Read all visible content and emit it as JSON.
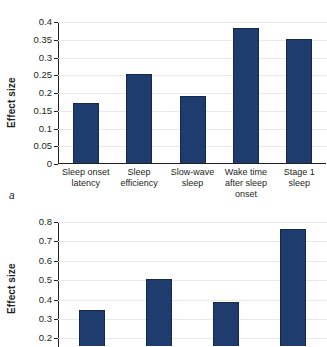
{
  "figure": {
    "panels": [
      {
        "letter": "a",
        "ylabel": "Effect size",
        "chart_data": {
          "type": "bar",
          "title": "",
          "xlabel": "",
          "ylabel": "Effect size",
          "categories": [
            "Sleep onset latency",
            "Sleep efficiency",
            "Slow-wave sleep",
            "Wake time after sleep onset",
            "Stage 1 sleep"
          ],
          "values": [
            0.17,
            0.25,
            0.19,
            0.38,
            0.35
          ],
          "ylim": [
            0,
            0.4
          ],
          "yticks": [
            0,
            0.05,
            0.1,
            0.15,
            0.2,
            0.25,
            0.3,
            0.35,
            0.4
          ],
          "ytick_labels": [
            "0",
            "0.05",
            "0.1",
            "0.15",
            "0.2",
            "0.25",
            "0.3",
            "0.35",
            "0.4"
          ],
          "grid": true,
          "legend": false,
          "bar_color": "#1e3c6e"
        }
      },
      {
        "letter": "b",
        "ylabel": "Effect size",
        "chart_data": {
          "type": "bar",
          "title": "",
          "xlabel": "",
          "ylabel": "Effect size",
          "categories": [
            "",
            "",
            "",
            ""
          ],
          "values": [
            0.34,
            0.5,
            0.38,
            0.76
          ],
          "ylim": [
            0,
            0.8
          ],
          "yticks": [
            0.2,
            0.3,
            0.4,
            0.5,
            0.6,
            0.7,
            0.8
          ],
          "ytick_labels": [
            "0.2",
            "0.3",
            "0.4",
            "0.5",
            "0.6",
            "0.7",
            "0.8"
          ],
          "grid": true,
          "legend": false,
          "cropped_bottom": true,
          "bar_color": "#1e3c6e"
        }
      }
    ]
  }
}
